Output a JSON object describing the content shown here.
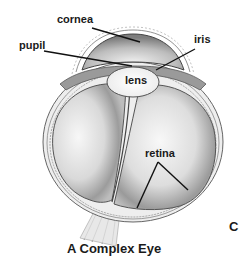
{
  "figure": {
    "caption": "A Complex Eye",
    "panel_letter": "C"
  },
  "labels": {
    "cornea": "cornea",
    "pupil": "pupil",
    "iris": "iris",
    "lens": "lens",
    "retina": "retina"
  },
  "colors": {
    "outline": "#555555",
    "leader_line": "#111111",
    "shade_dark": "#8a8a8a",
    "shade_light": "#f4f4f4"
  }
}
